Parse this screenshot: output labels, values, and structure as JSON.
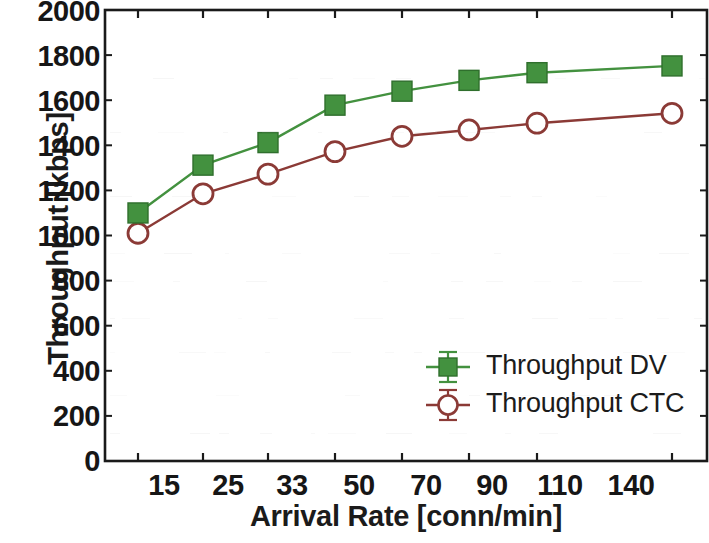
{
  "chart_data": {
    "type": "line",
    "title": "",
    "subtitle": "",
    "xlabel": "Arrival Rate [conn/min]",
    "ylabel": "Throughput [kbps]",
    "categories": [
      "15",
      "25",
      "33",
      "50",
      "70",
      "90",
      "110",
      "140"
    ],
    "x_tick_labels": [
      "15",
      "25",
      "33",
      "50",
      "70",
      "90",
      "110",
      "140"
    ],
    "y_tick_labels": [
      "0",
      "200",
      "400",
      "600",
      "800",
      "1000",
      "1200",
      "1400",
      "1600",
      "1800",
      "2000"
    ],
    "y_ticks": [
      0,
      200,
      400,
      600,
      800,
      1000,
      1200,
      1400,
      1600,
      1800,
      2000
    ],
    "ylim": [
      0,
      2000
    ],
    "grid": false,
    "legend_position": "lower right",
    "series": [
      {
        "name": "Throughput DV",
        "color": "#43913f",
        "marker": "filled-square",
        "values": [
          1100,
          1312,
          1412,
          1578,
          1640,
          1688,
          1722,
          1752
        ],
        "errors": [
          30,
          18,
          20,
          12,
          12,
          10,
          10,
          10
        ]
      },
      {
        "name": "Throughput CTC",
        "color": "#8b3a36",
        "marker": "open-circle",
        "values": [
          1010,
          1185,
          1272,
          1372,
          1440,
          1468,
          1498,
          1542
        ],
        "errors": [
          20,
          14,
          12,
          10,
          10,
          10,
          10,
          10
        ]
      }
    ]
  },
  "legend": {
    "items": [
      {
        "label": "Throughput DV",
        "marker": "filled-square",
        "color": "#43913f"
      },
      {
        "label": "Throughput CTC",
        "marker": "open-circle",
        "color": "#8b3a36"
      }
    ]
  },
  "axes": {
    "frame_color": "#1a1a1a",
    "background": "#ffffff"
  }
}
